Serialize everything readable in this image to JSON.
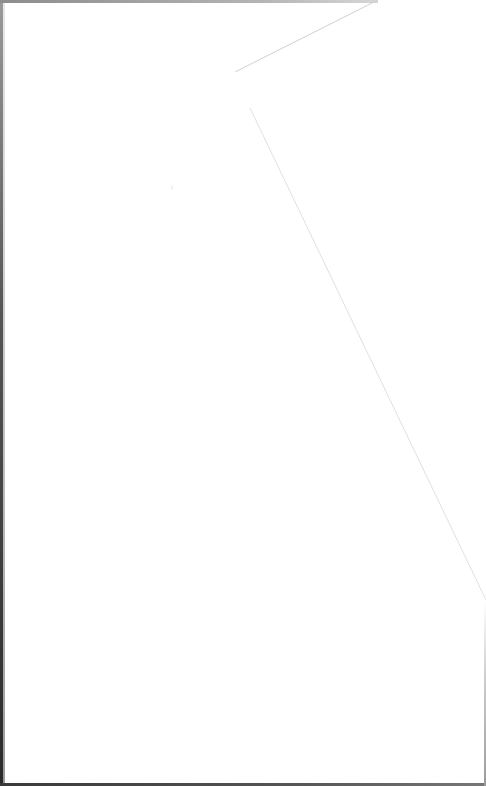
{
  "document": {
    "type": "scanned-page",
    "content": "",
    "colors": {
      "paper": "#ffffff",
      "fold_line": "#dcdcdc",
      "scan_edge_dark": "#2a2a2a",
      "scan_edge_light": "#9a9a9a"
    }
  }
}
